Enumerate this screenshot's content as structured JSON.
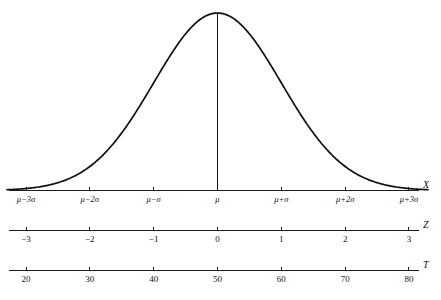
{
  "figure": {
    "title": "",
    "background_color": "#ffffff",
    "ink_color": "#111111"
  },
  "chart_data": {
    "type": "line",
    "title": "",
    "subtitle": "",
    "xlabel": "",
    "ylabel": "",
    "grid": false,
    "legend": false,
    "curve": {
      "name": "normal-distribution-curve",
      "distribution": "normal",
      "mean": 0,
      "sd": 1,
      "x_range": [
        -3.3,
        3.3
      ],
      "description": "bell-shaped normal curve with vertical line at the mean",
      "relative_heights_at_sigma": {
        "0": 1.0,
        "1": 0.6065,
        "2": 0.1353,
        "3": 0.0111
      }
    },
    "mean_marker": {
      "name": "mean-vertical-line",
      "at_x": 0,
      "from_baseline_to_peak": true
    },
    "axes": [
      {
        "id": "x-axis",
        "name": "X",
        "label_style": "italic",
        "ticks": [
          -3,
          -2,
          -1,
          0,
          1,
          2,
          3
        ],
        "tick_labels": [
          "μ−3σ",
          "μ−2σ",
          "μ−σ",
          "μ",
          "μ+σ",
          "μ+2σ",
          "μ+3σ"
        ]
      },
      {
        "id": "z-axis",
        "name": "Z",
        "label_style": "italic",
        "ticks": [
          -3,
          -2,
          -1,
          0,
          1,
          2,
          3
        ],
        "tick_labels": [
          "−3",
          "−2",
          "−1",
          "0",
          "1",
          "2",
          "3"
        ]
      },
      {
        "id": "t-axis",
        "name": "T",
        "label_style": "italic",
        "ticks": [
          -3,
          -2,
          -1,
          0,
          1,
          2,
          3
        ],
        "tick_labels": [
          "20",
          "30",
          "40",
          "50",
          "60",
          "70",
          "80"
        ]
      }
    ]
  }
}
